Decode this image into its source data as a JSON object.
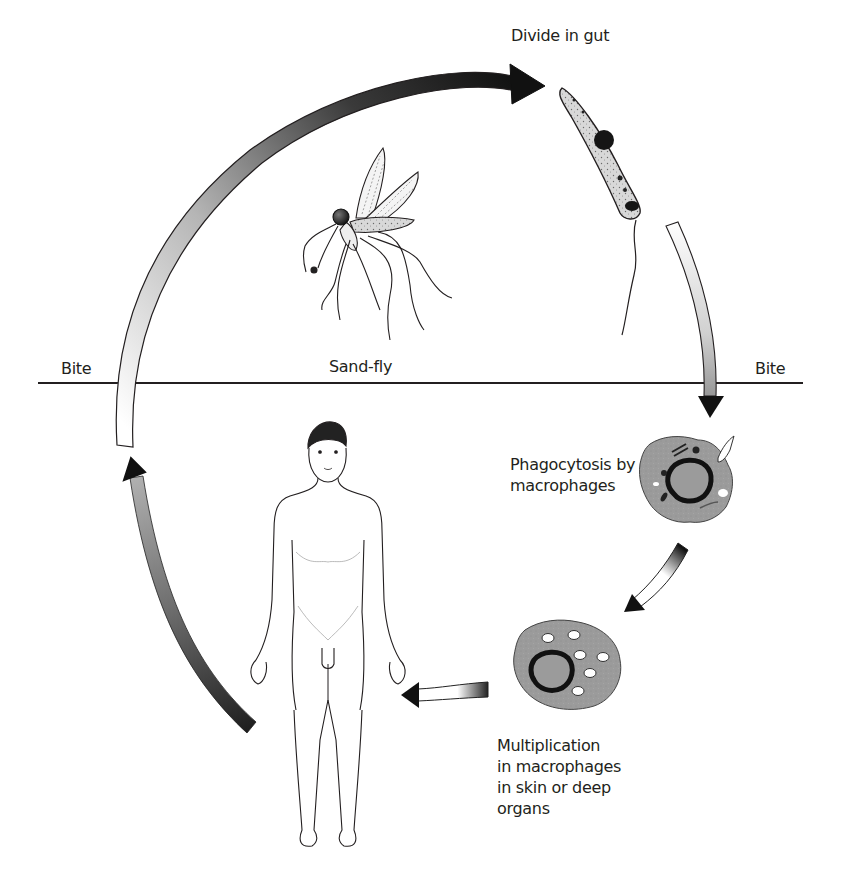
{
  "diagram": {
    "type": "life-cycle",
    "labels": {
      "divide_in_gut": "Divide in gut",
      "sand_fly": "Sand-fly",
      "bite_left": "Bite",
      "bite_right": "Bite",
      "phagocytosis": "Phagocytosis by\nmacrophages",
      "multiplication": "Multiplication\nin macrophages\nin skin or deep\norgans"
    },
    "stages": [
      {
        "id": "sandfly",
        "label": "Sand-fly",
        "icon": "sandfly-icon"
      },
      {
        "id": "promastigote",
        "label": "Divide in gut",
        "icon": "promastigote-icon"
      },
      {
        "id": "phagocytosis",
        "label": "Phagocytosis by macrophages",
        "icon": "macrophage-icon"
      },
      {
        "id": "multiplication",
        "label": "Multiplication in macrophages in skin or deep organs",
        "icon": "infected-macrophage-icon"
      },
      {
        "id": "human",
        "label": "Human host",
        "icon": "human-figure-icon"
      }
    ],
    "divider": {
      "left_label": "Bite",
      "right_label": "Bite"
    },
    "colors": {
      "ink": "#231f20",
      "cell_fill": "#9a9a9a",
      "cell_dark": "#1e1e1e",
      "arrow_dark": "#111111",
      "arrow_light": "#ffffff"
    }
  }
}
